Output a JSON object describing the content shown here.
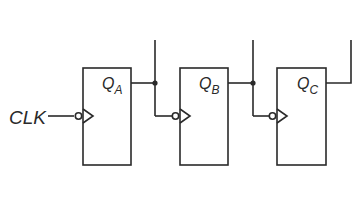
{
  "diagram": {
    "type": "ripple-counter",
    "clock_label": "CLK",
    "flip_flops": [
      {
        "id": "A",
        "output_label": "Q",
        "output_sub": "A"
      },
      {
        "id": "B",
        "output_label": "Q",
        "output_sub": "B"
      },
      {
        "id": "C",
        "output_label": "Q",
        "output_sub": "C"
      }
    ],
    "colors": {
      "stroke": "#2a2a2a",
      "background": "#ffffff"
    }
  }
}
